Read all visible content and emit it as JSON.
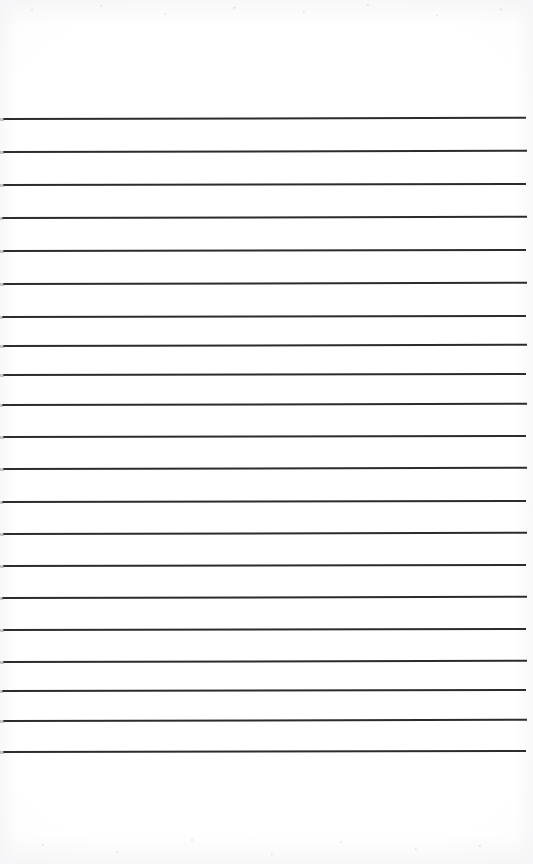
{
  "document": {
    "kind": "scanned-lined-notebook-page",
    "title": "Blank ruled notebook page",
    "page_width": 533,
    "page_height": 864,
    "background_color": "#ffffff",
    "has_text_content": false,
    "written_content": "",
    "orientation": "portrait"
  },
  "paper": {
    "tint_color": "#ffffff",
    "edge_shadow_color": "#f6f6f8",
    "noise_color": "#cdcdd2",
    "top_margin_px": 118,
    "bottom_margin_px": 113,
    "left_margin_px": 3,
    "right_margin_px": 7
  },
  "ruling": {
    "line_color": "#2c2c30",
    "line_thickness_px": 1.6,
    "line_count": 20,
    "line_spacing_px": 33.3,
    "line_start_x": 3,
    "line_end_x": 526,
    "first_line_y": 118,
    "last_line_y": 751,
    "skew_note": "slight scan skew, lines tilt about -0.12 degrees",
    "lines": [
      {
        "index": 1,
        "y": 118,
        "x1": 3,
        "x2": 526,
        "skew_deg": -0.14
      },
      {
        "index": 2,
        "y": 151,
        "x1": 3,
        "x2": 527,
        "skew_deg": -0.13
      },
      {
        "index": 3,
        "y": 184,
        "x1": 3,
        "x2": 526,
        "skew_deg": -0.12
      },
      {
        "index": 4,
        "y": 217,
        "x1": 2,
        "x2": 527,
        "skew_deg": -0.14
      },
      {
        "index": 5,
        "y": 250,
        "x1": 3,
        "x2": 526,
        "skew_deg": -0.11
      },
      {
        "index": 6,
        "y": 283,
        "x1": 3,
        "x2": 527,
        "skew_deg": -0.13
      },
      {
        "index": 7,
        "y": 316,
        "x1": 2,
        "x2": 526,
        "skew_deg": -0.12
      },
      {
        "index": 8,
        "y": 345,
        "x1": 3,
        "x2": 527,
        "skew_deg": -0.14
      },
      {
        "index": 9,
        "y": 374,
        "x1": 3,
        "x2": 526,
        "skew_deg": -0.12
      },
      {
        "index": 10,
        "y": 404,
        "x1": 2,
        "x2": 527,
        "skew_deg": -0.13
      },
      {
        "index": 11,
        "y": 436,
        "x1": 3,
        "x2": 526,
        "skew_deg": -0.12
      },
      {
        "index": 12,
        "y": 468,
        "x1": 3,
        "x2": 527,
        "skew_deg": -0.14
      },
      {
        "index": 13,
        "y": 501,
        "x1": 2,
        "x2": 526,
        "skew_deg": -0.11
      },
      {
        "index": 14,
        "y": 533,
        "x1": 3,
        "x2": 527,
        "skew_deg": -0.13
      },
      {
        "index": 15,
        "y": 565,
        "x1": 3,
        "x2": 526,
        "skew_deg": -0.12
      },
      {
        "index": 16,
        "y": 597,
        "x1": 2,
        "x2": 527,
        "skew_deg": -0.14
      },
      {
        "index": 17,
        "y": 629,
        "x1": 3,
        "x2": 526,
        "skew_deg": -0.12
      },
      {
        "index": 18,
        "y": 661,
        "x1": 3,
        "x2": 527,
        "skew_deg": -0.13
      },
      {
        "index": 19,
        "y": 690,
        "x1": 2,
        "x2": 526,
        "skew_deg": -0.12
      },
      {
        "index": 20,
        "y": 720,
        "x1": 3,
        "x2": 527,
        "skew_deg": -0.14
      },
      {
        "index": 21,
        "y": 751,
        "x1": 3,
        "x2": 526,
        "skew_deg": -0.12
      }
    ]
  }
}
